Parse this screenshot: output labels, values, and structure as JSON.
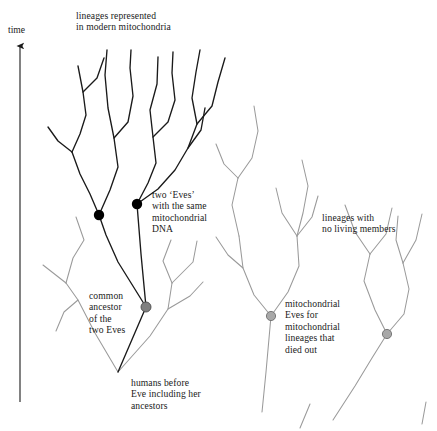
{
  "figure": {
    "background_color": "#ffffff"
  },
  "axis": {
    "time_label": "time",
    "direction": "upward"
  },
  "labels": {
    "modern_lineages": "lineages represented\nin modern mitochondria",
    "two_eves": "two ‘Eves’\nwith the same\nmitochondrial\nDNA",
    "common_ancestor": "common\nancestor\nof the\ntwo Eves",
    "humans_before_eve": "humans before\nEve including her\nancestors",
    "no_living_members": "lineages with\nno living members",
    "mitochondrial_eves_died_out": "mitochondrial\nEves for\nmitochondrial\nlineages that\ndied out"
  },
  "colors": {
    "surviving_lineage": "#1a1a1a",
    "extinct_lineage": "#9a9a9a",
    "eve_node": "#000000",
    "common_ancestor_node": "#808080",
    "text": "#1a1a1a"
  },
  "nodes": {
    "eve_left": {
      "x": 99,
      "y": 215,
      "r": 5.2,
      "type": "eve"
    },
    "eve_right": {
      "x": 137,
      "y": 204,
      "r": 5.2,
      "type": "eve"
    },
    "common_ancestor": {
      "x": 146,
      "y": 307,
      "r": 5.0,
      "type": "common-ancestor"
    },
    "extinct_eve_mid": {
      "x": 271,
      "y": 316,
      "r": 4.6,
      "type": "extinct-eve"
    },
    "extinct_eve_right": {
      "x": 387,
      "y": 334,
      "r": 4.6,
      "type": "extinct-eve"
    }
  }
}
